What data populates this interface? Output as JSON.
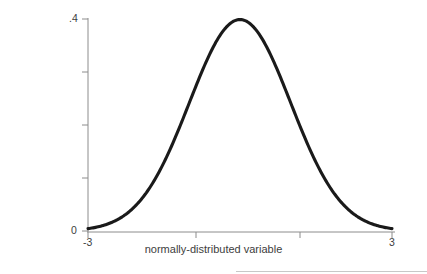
{
  "figure": {
    "background_color": "#ffffff",
    "curve_color": "#1a1a1a",
    "axis_color": "#8c8c8c",
    "text_color": "#3d3d3d"
  },
  "axes": {
    "x_title": "normally-distributed variable",
    "y_title": "probability density",
    "x_tick_labels": [
      "-3",
      "3"
    ],
    "y_tick_labels": [
      ".4",
      "0"
    ],
    "y_min_label": "0",
    "y_max_label": ".4"
  },
  "chart_data": {
    "type": "line",
    "title": "",
    "subtitle": "",
    "xlabel": "normally-distributed variable",
    "ylabel": "probability density",
    "xlim": [
      -3,
      3
    ],
    "ylim": [
      0,
      0.42
    ],
    "grid": false,
    "legend": null,
    "legend_position": "none",
    "x_ticks": [
      -3,
      -1,
      1,
      3
    ],
    "x_tick_labels": [
      "-3",
      "",
      "",
      "3"
    ],
    "y_ticks": [
      0,
      0.1,
      0.2,
      0.3,
      0.4
    ],
    "y_tick_labels": [
      "0",
      "",
      "",
      "",
      ".4"
    ],
    "distribution": "standard normal (mean 0, sd 1)",
    "series": [
      {
        "name": "normal probability density",
        "x": [
          -3,
          -2.8,
          -2.6,
          -2.4,
          -2.2,
          -2,
          -1.8,
          -1.6,
          -1.4,
          -1.2,
          -1,
          -0.8,
          -0.6,
          -0.4,
          -0.2,
          0,
          0.2,
          0.4,
          0.6,
          0.8,
          1,
          1.2,
          1.4,
          1.6,
          1.8,
          2,
          2.2,
          2.4,
          2.6,
          2.8,
          3
        ],
        "y": [
          0.0044,
          0.0079,
          0.0136,
          0.0224,
          0.0355,
          0.054,
          0.079,
          0.1109,
          0.1497,
          0.1942,
          0.242,
          0.2897,
          0.3332,
          0.3683,
          0.391,
          0.3989,
          0.391,
          0.3683,
          0.3332,
          0.2897,
          0.242,
          0.1942,
          0.1497,
          0.1109,
          0.079,
          0.054,
          0.0355,
          0.0224,
          0.0136,
          0.0079,
          0.0044
        ]
      }
    ],
    "annotations": [],
    "peak": {
      "x": 0,
      "y": 0.3989
    }
  }
}
